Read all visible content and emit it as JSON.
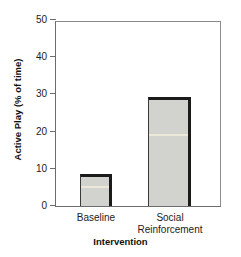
{
  "chart_data": {
    "type": "bar",
    "title": "",
    "xlabel": "Intervention",
    "ylabel": "Active Play (% of time)",
    "categories": [
      "Baseline",
      "Social\nReinforcement"
    ],
    "values": [
      8.6,
      29.3
    ],
    "ylim": [
      0,
      50
    ],
    "yticks": [
      0,
      10,
      20,
      30,
      40,
      50
    ],
    "ytick_labels": [
      "0",
      "10",
      "20",
      "30",
      "40",
      "50"
    ],
    "grid": false,
    "legend": null,
    "series": [
      {
        "name": "Active Play",
        "values": [
          8.6,
          29.3
        ]
      }
    ],
    "colors": {
      "bar_fill": "#d2d2ce",
      "bar_edge": "#1b1b1b",
      "axis": "#6d6d6d",
      "text": "#1c1c1c"
    }
  }
}
